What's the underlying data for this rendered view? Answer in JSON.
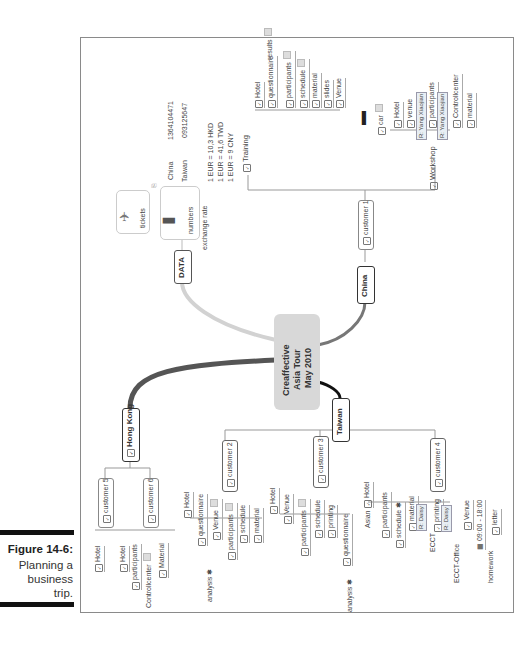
{
  "caption": {
    "figure": "Figure 14-6:",
    "lines": [
      "Planning a",
      "business",
      "trip."
    ]
  },
  "central": {
    "lines": [
      "Creaffective",
      "Asia Tour",
      "May 2010"
    ]
  },
  "branches": {
    "data": {
      "label": "DATA",
      "tickets": "tickets",
      "numbers": "numbers",
      "phone_china_label": "China",
      "phone_china": "1364104471",
      "phone_taiwan_label": "Taiwan",
      "phone_taiwan": "093125647",
      "exchange_label": "exchange rate",
      "rates": [
        "1 EUR = 10,3 HKD",
        "1 EUR = 41,6 TWD",
        "1 EUR = 9 CNY"
      ]
    },
    "china": {
      "label": "China",
      "customer": "customer 1",
      "training": "Training",
      "training_items": [
        "Hotel",
        "questionnaire",
        "participants",
        "schedule",
        "material",
        "slides",
        "Venue",
        "car"
      ],
      "results": "results",
      "workshop": "Workshop",
      "workshop_items": [
        "Hotel",
        "venue",
        "participants",
        "Controllcenter",
        "material"
      ],
      "resource": "R: Yang Xiaojian"
    },
    "hongkong": {
      "label": "Hong Kong",
      "customer5": "customer 5",
      "customer5_items": [
        "Hotel"
      ],
      "customer6": "customer 6",
      "customer6_items": [
        "Hotel",
        "participants",
        "Controllcenter",
        "Material"
      ]
    },
    "taiwan": {
      "label": "Taiwan",
      "customer2": "customer 2",
      "customer2_items": [
        "Hotel",
        "questionnaire",
        "Venue",
        "participants",
        "schedule",
        "material"
      ],
      "customer3": "customer 3",
      "customer3_items": [
        "Hotel",
        "Venue",
        "participants",
        "schedule",
        "printing",
        "questionnaire"
      ],
      "analysis": "analysis",
      "customer4": "customer 4",
      "asian": "Asian",
      "customer4_items": [
        "Hotel",
        "participants",
        "schedule",
        "material",
        "printing",
        "Venue",
        "letter"
      ],
      "resource": "R: Daisy",
      "ecct": "ECCT",
      "ecct_office": "ECCT-Office",
      "time": "09:00 - 18:00",
      "homework": "homework"
    }
  },
  "colors": {
    "data_branch": "#d0d0d0",
    "hongkong_branch": "#555555",
    "taiwan_branch": "#1a1a1a",
    "china_branch": "#777777",
    "central_bg": "#d8d8d8"
  }
}
